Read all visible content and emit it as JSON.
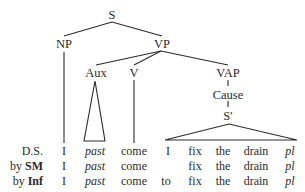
{
  "tree": {
    "nodes": {
      "s": "S",
      "np": "NP",
      "vp": "VP",
      "aux": "Aux",
      "v": "V",
      "vap": "VAP",
      "cause": "Cause",
      "s_prime": "S′"
    }
  },
  "rows": [
    {
      "label_prefix": "",
      "label_bold": "",
      "label_plain": "D.S.",
      "cells": [
        "I",
        "past",
        "come",
        "I",
        "fix",
        "the",
        "drain",
        "pl"
      ]
    },
    {
      "label_prefix": "by ",
      "label_bold": "SM",
      "label_plain": "",
      "cells": [
        "I",
        "past",
        "come",
        "",
        "fix",
        "the",
        "drain",
        "pl"
      ]
    },
    {
      "label_prefix": "by ",
      "label_bold": "Inf",
      "label_plain": "",
      "cells": [
        "I",
        "past",
        "come",
        "to",
        "fix",
        "the",
        "drain",
        "pl"
      ]
    }
  ]
}
